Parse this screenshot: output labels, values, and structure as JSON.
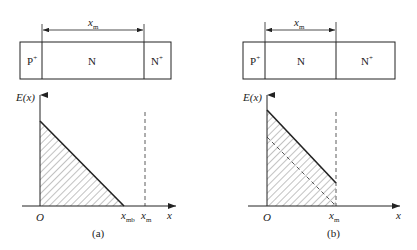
{
  "panels": [
    {
      "id": "a",
      "caption": "(a)",
      "regions": {
        "p": "P",
        "p_sup": "+",
        "n": "N",
        "nplus": "N",
        "nplus_sup": "+"
      },
      "dimension": {
        "label": "x",
        "sub": "m"
      },
      "axes": {
        "ylabel": "E(x)",
        "xlabel": "x",
        "origin": "O"
      },
      "ticks": [
        {
          "label": "x",
          "sub": "mb"
        },
        {
          "label": "x",
          "sub": "m"
        }
      ],
      "description": "Punch-through not reached: field triangle ends at x_mb before x_m"
    },
    {
      "id": "b",
      "caption": "(b)",
      "regions": {
        "p": "P",
        "p_sup": "+",
        "n": "N",
        "nplus": "N",
        "nplus_sup": "+"
      },
      "dimension": {
        "label": "x",
        "sub": "m"
      },
      "axes": {
        "ylabel": "E(x)",
        "xlabel": "x",
        "origin": "O"
      },
      "ticks": [
        {
          "label": "x",
          "sub": "m"
        }
      ],
      "description": "Punch-through: field trapezoid truncated at x_m"
    }
  ],
  "colors": {
    "stroke": "#222222",
    "hatch": "#555555",
    "background": "#ffffff"
  }
}
